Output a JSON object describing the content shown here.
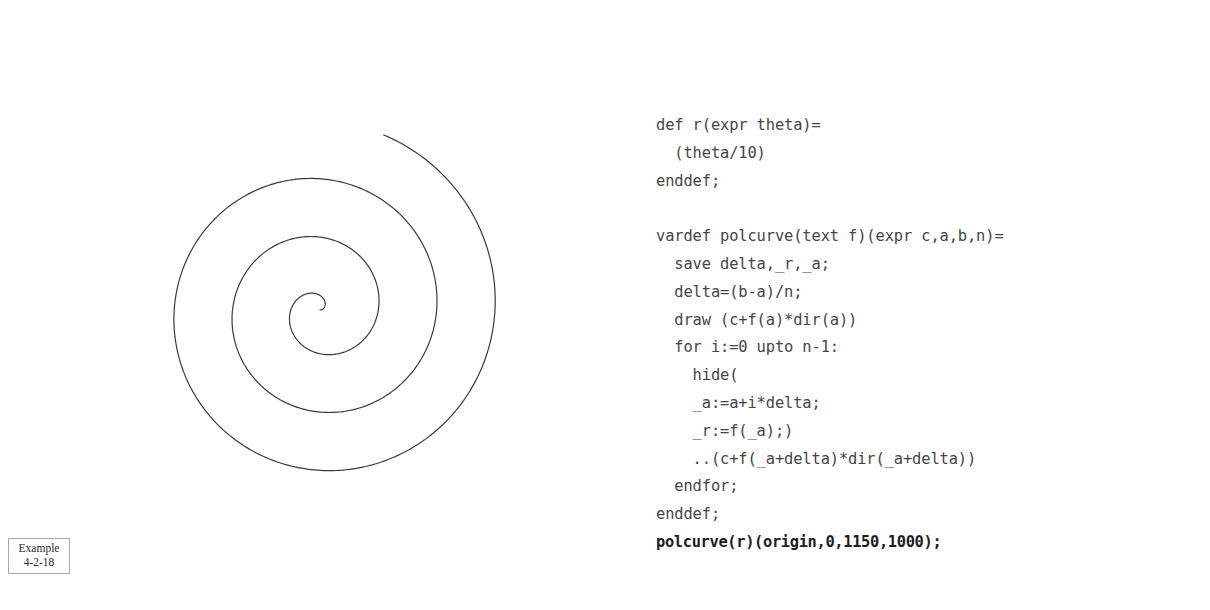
{
  "page": {
    "background_color": "#fefefe",
    "width": 1210,
    "height": 610
  },
  "example_tag": {
    "name": "Example",
    "number": "4-2-18",
    "border_color": "#a9a9a9"
  },
  "figure": {
    "caption": "Archimedean spiral drawn by polcurve",
    "stroke_color": "#3a3a3a",
    "stroke_width": 1.2,
    "center_x": 320,
    "center_y": 310,
    "theta_start_deg": 0,
    "theta_end_deg": 1150,
    "radius_divisor": 10,
    "pixels_per_unit": 1.62,
    "samples": 1000
  },
  "code": {
    "language": "MetaPost",
    "text_color": "#454545",
    "highlight_color": "#1d1d1d",
    "lines": [
      {
        "text": "def r(expr theta)=",
        "strong": false,
        "blank": false
      },
      {
        "text": "  (theta/10)",
        "strong": false,
        "blank": false
      },
      {
        "text": "enddef;",
        "strong": false,
        "blank": false
      },
      {
        "text": " ",
        "strong": false,
        "blank": true
      },
      {
        "text": "vardef polcurve(text f)(expr c,a,b,n)=",
        "strong": false,
        "blank": false
      },
      {
        "text": "  save delta,_r,_a;",
        "strong": false,
        "blank": false
      },
      {
        "text": "  delta=(b-a)/n;",
        "strong": false,
        "blank": false
      },
      {
        "text": "  draw (c+f(a)*dir(a))",
        "strong": false,
        "blank": false
      },
      {
        "text": "  for i:=0 upto n-1:",
        "strong": false,
        "blank": false
      },
      {
        "text": "    hide(",
        "strong": false,
        "blank": false
      },
      {
        "text": "    _a:=a+i*delta;",
        "strong": false,
        "blank": false
      },
      {
        "text": "    _r:=f(_a);)",
        "strong": false,
        "blank": false
      },
      {
        "text": "    ..(c+f(_a+delta)*dir(_a+delta))",
        "strong": false,
        "blank": false
      },
      {
        "text": "  endfor;",
        "strong": false,
        "blank": false
      },
      {
        "text": "enddef;",
        "strong": false,
        "blank": false
      },
      {
        "text": "polcurve(r)(origin,0,1150,1000);",
        "strong": true,
        "blank": false
      }
    ]
  }
}
